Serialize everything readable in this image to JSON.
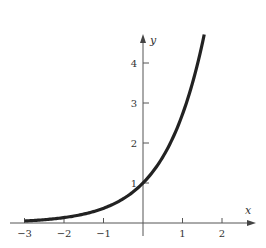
{
  "chart_data": {
    "type": "line",
    "title": "",
    "function": "y = e^x",
    "xlabel": "x",
    "ylabel": "y",
    "xlim": [
      -3.1,
      2.5
    ],
    "ylim": [
      0,
      4.7
    ],
    "grid": false,
    "legend": null,
    "x_ticks": [
      -3,
      -2,
      -1,
      1,
      2
    ],
    "x_tick_labels": [
      "−3",
      "−2",
      "−1",
      "1",
      "2"
    ],
    "y_ticks": [
      1,
      2,
      3,
      4
    ],
    "y_tick_labels": [
      "1",
      "2",
      "3",
      "4"
    ],
    "series": [
      {
        "name": "e^x",
        "color": "#222222",
        "x": [
          -3,
          -2.5,
          -2,
          -1.5,
          -1,
          -0.5,
          0,
          0.25,
          0.5,
          0.75,
          1,
          1.25,
          1.5,
          1.55
        ],
        "y": [
          0.05,
          0.08,
          0.14,
          0.22,
          0.37,
          0.61,
          1.0,
          1.28,
          1.65,
          2.12,
          2.72,
          3.49,
          4.48,
          4.71
        ]
      }
    ]
  }
}
